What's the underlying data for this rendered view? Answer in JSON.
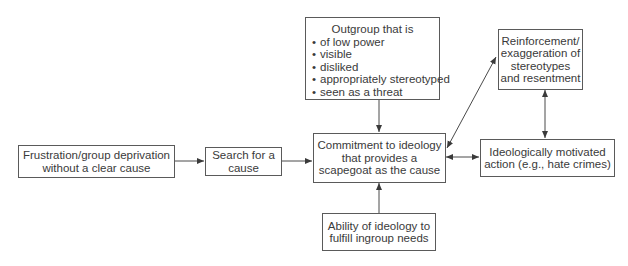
{
  "diagram": {
    "nodes": {
      "frustration": {
        "lines": [
          "Frustration/group deprivation",
          "without a clear cause"
        ]
      },
      "search": {
        "lines": [
          "Search for a",
          "cause"
        ]
      },
      "commitment": {
        "lines": [
          "Commitment to ideology",
          "that provides a",
          "scapegoat as the cause"
        ]
      },
      "outgroup": {
        "heading": "Outgroup that is",
        "items": [
          "of low power",
          "visible",
          "disliked",
          "appropriately stereotyped",
          "seen as a threat"
        ]
      },
      "ability": {
        "lines": [
          "Ability of ideology to",
          "fulfill ingroup needs"
        ]
      },
      "reinforcement": {
        "lines": [
          "Reinforcement/",
          "exaggeration of",
          "stereotypes",
          "and resentment"
        ]
      },
      "action": {
        "lines": [
          "Ideologically motivated",
          "action (e.g., hate crimes)"
        ]
      }
    },
    "edges": [
      {
        "from": "frustration",
        "to": "search",
        "type": "arrow"
      },
      {
        "from": "search",
        "to": "commitment",
        "type": "arrow"
      },
      {
        "from": "outgroup",
        "to": "commitment",
        "type": "arrow"
      },
      {
        "from": "ability",
        "to": "commitment",
        "type": "arrow"
      },
      {
        "from": "commitment",
        "to": "reinforcement",
        "type": "bidirectional"
      },
      {
        "from": "commitment",
        "to": "action",
        "type": "bidirectional"
      },
      {
        "from": "reinforcement",
        "to": "action",
        "type": "bidirectional"
      }
    ],
    "colors": {
      "line": "#4a4a4a",
      "text": "#3a3a3a",
      "background": "#ffffff"
    }
  }
}
